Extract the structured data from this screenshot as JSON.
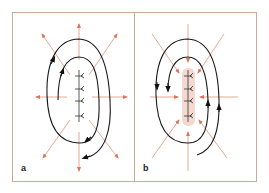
{
  "figure": {
    "panels": [
      {
        "id": "a",
        "label": "a",
        "description": "Outward radial field arrows around a vertical dipole chain, with circulating loop arrows",
        "field_direction": "outward",
        "loop_arrows": [
          "counterclockwise-upper-left",
          "clockwise-lower-right"
        ],
        "dipole_count": 4
      },
      {
        "id": "b",
        "label": "b",
        "description": "Inward radial field arrows converging on a shaded vertical dipole chain, with circulating loop arrows",
        "field_direction": "inward",
        "loop_arrows": [
          "downward-left",
          "upward-right"
        ],
        "dipole_count": 4,
        "shaded_core": true
      }
    ],
    "colors": {
      "frame": "#c9ab9c",
      "field_arrows": "#e0735a",
      "field_lines_faint": "#e7a896",
      "loops": "#1a1a1a",
      "shaded_core": "#f3d9cf",
      "label": "#222222"
    }
  }
}
